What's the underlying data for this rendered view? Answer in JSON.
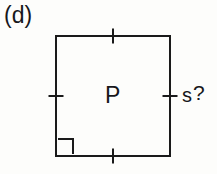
{
  "figure": {
    "part_label": "(d)",
    "interior_label": "P",
    "side_label_value": "s",
    "side_label_query": "?",
    "shape": "square",
    "stroke_color": "#1a1a1a",
    "text_color": "#17171a",
    "background_color": "#fdfdfb",
    "stroke_width": 2,
    "square": {
      "left": 56,
      "top": 36,
      "right": 170,
      "bottom": 156,
      "width": 114,
      "height": 120
    },
    "tick_marks": {
      "count": 4,
      "name": "congruence-tick",
      "description": "single hash mark at the midpoint of each side",
      "length": 15,
      "positions": [
        {
          "side": "top",
          "x": 113,
          "y": 36
        },
        {
          "side": "right",
          "x": 170,
          "y": 96
        },
        {
          "side": "bottom",
          "x": 113,
          "y": 156
        },
        {
          "side": "left",
          "x": 56,
          "y": 96
        }
      ]
    },
    "right_angle_marker": {
      "corner": "bottom-left",
      "x": 58,
      "y": 139,
      "size": 15
    },
    "interior_label_position": {
      "x": 105,
      "y": 84
    },
    "side_label_position": {
      "x": 182,
      "y": 84
    }
  }
}
